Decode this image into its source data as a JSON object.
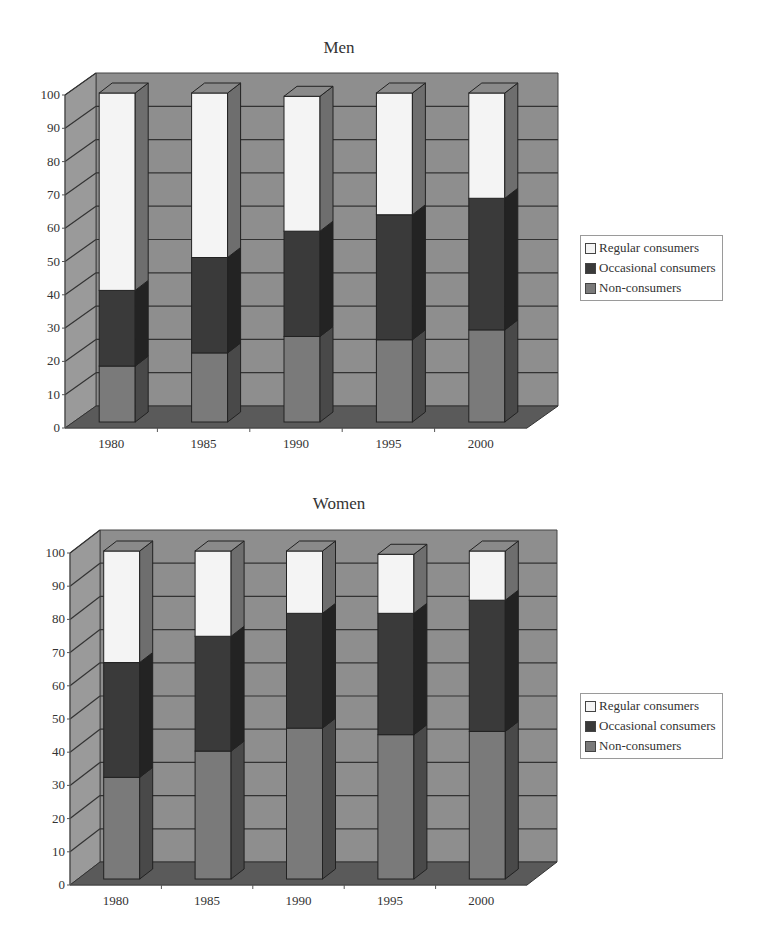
{
  "colors": {
    "regular": "#f4f4f4",
    "occasional": "#3a3a3a",
    "non": "#7a7a7a",
    "back_wall": "#8e8e8e",
    "side_wall": "#9a9a9a",
    "floor": "#5a5a5a",
    "gridline": "#333333"
  },
  "legend_labels": [
    "Regular consumers",
    "Occasional consumers",
    "Non-consumers"
  ],
  "chart_data": [
    {
      "type": "bar",
      "stacked": true,
      "three_d": true,
      "title": "Men",
      "categories": [
        "1980",
        "1985",
        "1990",
        "1995",
        "2000"
      ],
      "series": [
        {
          "name": "Non-consumers",
          "values": [
            17,
            21,
            26,
            25,
            28
          ]
        },
        {
          "name": "Occasional consumers",
          "values": [
            23,
            29,
            32,
            38,
            40
          ]
        },
        {
          "name": "Regular consumers",
          "values": [
            60,
            50,
            41,
            37,
            32
          ]
        }
      ],
      "xlabel": "",
      "ylabel": "",
      "yticks": [
        0,
        10,
        20,
        30,
        40,
        50,
        60,
        70,
        80,
        90,
        100
      ],
      "ylim": [
        0,
        100
      ],
      "grid": true,
      "legend_position": "right"
    },
    {
      "type": "bar",
      "stacked": true,
      "three_d": true,
      "title": "Women",
      "categories": [
        "1980",
        "1985",
        "1990",
        "1995",
        "2000"
      ],
      "series": [
        {
          "name": "Non-consumers",
          "values": [
            31,
            39,
            46,
            44,
            45
          ]
        },
        {
          "name": "Occasional consumers",
          "values": [
            35,
            35,
            35,
            37,
            40
          ]
        },
        {
          "name": "Regular consumers",
          "values": [
            34,
            26,
            19,
            18,
            15
          ]
        }
      ],
      "xlabel": "",
      "ylabel": "",
      "yticks": [
        0,
        10,
        20,
        30,
        40,
        50,
        60,
        70,
        80,
        90,
        100
      ],
      "ylim": [
        0,
        100
      ],
      "grid": true,
      "legend_position": "right"
    }
  ],
  "charts": [
    {
      "title": "Men",
      "legend": {
        "items": [
          {
            "label": "Regular consumers",
            "color_key": "regular"
          },
          {
            "label": "Occasional consumers",
            "color_key": "occasional"
          },
          {
            "label": "Non-consumers",
            "color_key": "non"
          }
        ]
      }
    },
    {
      "title": "Women",
      "legend": {
        "items": [
          {
            "label": "Regular consumers",
            "color_key": "regular"
          },
          {
            "label": "Occasional consumers",
            "color_key": "occasional"
          },
          {
            "label": "Non-consumers",
            "color_key": "non"
          }
        ]
      }
    }
  ]
}
